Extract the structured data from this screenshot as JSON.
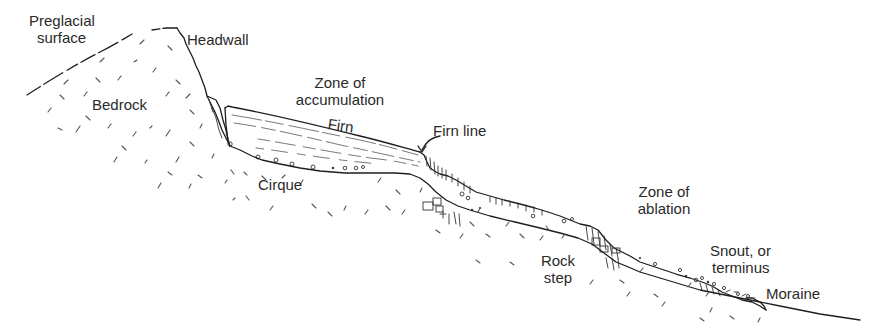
{
  "diagram": {
    "type": "glacier-profile",
    "labels": {
      "preglacial_surface_line1": "Preglacial",
      "preglacial_surface_line2": "surface",
      "headwall": "Headwall",
      "bedrock": "Bedrock",
      "zone_accumulation_line1": "Zone of",
      "zone_accumulation_line2": "accumulation",
      "firn": "Firn",
      "firn_line": "Firn line",
      "cirque": "Cirque",
      "zone_ablation_line1": "Zone of",
      "zone_ablation_line2": "ablation",
      "rock_step_line1": "Rock",
      "rock_step_line2": "step",
      "snout_line1": "Snout, or",
      "snout_line2": "terminus",
      "moraine": "Moraine"
    },
    "features": [
      {
        "name": "Preglacial surface",
        "kind": "dashed-line"
      },
      {
        "name": "Headwall",
        "kind": "steep-rock-face"
      },
      {
        "name": "Bedrock",
        "kind": "hatched-region"
      },
      {
        "name": "Zone of accumulation",
        "kind": "glacier-zone"
      },
      {
        "name": "Firn",
        "kind": "glacier-layer"
      },
      {
        "name": "Firn line",
        "kind": "boundary-arrow"
      },
      {
        "name": "Cirque",
        "kind": "basin"
      },
      {
        "name": "Zone of ablation",
        "kind": "glacier-zone"
      },
      {
        "name": "Rock step",
        "kind": "bedrock-step"
      },
      {
        "name": "Snout, or terminus",
        "kind": "glacier-end"
      },
      {
        "name": "Moraine",
        "kind": "deposit"
      }
    ],
    "colors": {
      "ink": "#1e1e1e",
      "background": "#ffffff"
    }
  }
}
